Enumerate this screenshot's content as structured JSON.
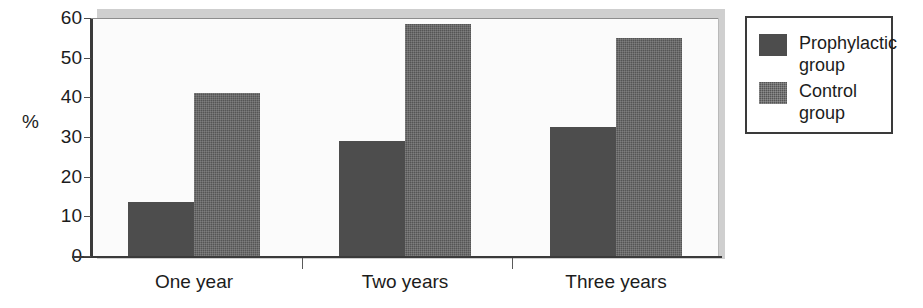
{
  "chart_data": {
    "type": "bar",
    "title": "",
    "subtitle": "",
    "xlabel": "",
    "ylabel": "%",
    "categories": [
      "One year",
      "Two years",
      "Three years"
    ],
    "series": [
      {
        "name": "Prophylactic group",
        "values": [
          13.5,
          29,
          32.5
        ],
        "color": "#4d4d4d"
      },
      {
        "name": "Control group",
        "values": [
          41,
          58.5,
          55
        ],
        "color": "#555555"
      }
    ],
    "ylim": [
      0,
      60
    ],
    "yticks": [
      0,
      10,
      20,
      30,
      40,
      50,
      60
    ],
    "ytick_labels": [
      "0",
      "10",
      "20",
      "30",
      "40",
      "50",
      "60"
    ],
    "grid": false,
    "legend_position": "right-outside",
    "bar_style": "adjacent-touching"
  },
  "axis": {
    "y_title": "%",
    "y_ticks": [
      {
        "label": "60",
        "value": 60
      },
      {
        "label": "50",
        "value": 50
      },
      {
        "label": "40",
        "value": 40
      },
      {
        "label": "30",
        "value": 30
      },
      {
        "label": "20",
        "value": 20
      },
      {
        "label": "10",
        "value": 10
      },
      {
        "label": "0",
        "value": 0
      }
    ],
    "x_categories": [
      {
        "label": "One year"
      },
      {
        "label": "Two years"
      },
      {
        "label": "Three years"
      }
    ]
  },
  "legend": {
    "entries": [
      {
        "label": "Prophylactic\ngroup",
        "swatch": "proph"
      },
      {
        "label": "Control\ngroup",
        "swatch": "control"
      }
    ]
  }
}
